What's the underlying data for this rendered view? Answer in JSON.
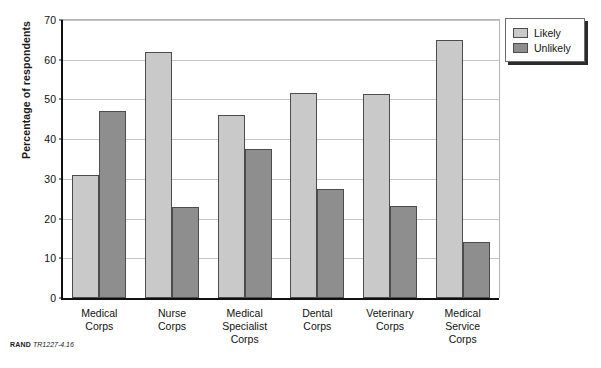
{
  "chart_data": {
    "type": "bar",
    "title": "",
    "xlabel": "",
    "ylabel": "Percentage of respondents",
    "ylim": [
      0,
      70
    ],
    "yticks": [
      0,
      10,
      20,
      30,
      40,
      50,
      60,
      70
    ],
    "grid": true,
    "legend_position": "top-right-outside",
    "categories": [
      "Medical\nCorps",
      "Nurse\nCorps",
      "Medical\nSpecialist\nCorps",
      "Dental\nCorps",
      "Veterinary\nCorps",
      "Medical\nService\nCorps"
    ],
    "series": [
      {
        "name": "Likely",
        "color": "#c9c9c9",
        "values": [
          31.0,
          62.0,
          46.0,
          51.5,
          51.3,
          65.0
        ]
      },
      {
        "name": "Unlikely",
        "color": "#8e8e8e",
        "values": [
          47.0,
          22.8,
          37.5,
          27.4,
          23.2,
          14.2
        ]
      }
    ]
  },
  "legend": {
    "items": [
      {
        "label": "Likely",
        "swatch": "likely"
      },
      {
        "label": "Unlikely",
        "swatch": "unlikely"
      }
    ]
  },
  "footer": {
    "brand": "RAND",
    "reference": "TR1227-4.16"
  },
  "colors": {
    "likely": "#c9c9c9",
    "unlikely": "#8e8e8e",
    "axis": "#111111",
    "gridline": "#c4c4c4",
    "background": "#ffffff"
  }
}
